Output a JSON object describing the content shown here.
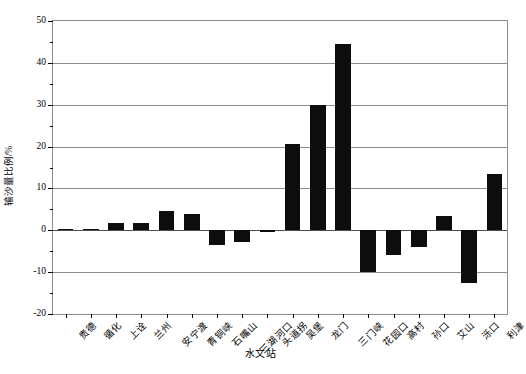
{
  "chart_data": {
    "type": "bar",
    "title": "",
    "xlabel": "水文站",
    "ylabel": "输沙量比例/%",
    "ylim": [
      -20,
      50
    ],
    "yticks": [
      -20,
      -10,
      0,
      10,
      20,
      30,
      40,
      50
    ],
    "ytick_labels": [
      "-20",
      "-10",
      "0",
      "10",
      "20",
      "30",
      "40",
      "50"
    ],
    "minor_ytick_step": 5,
    "grid": "horizontal",
    "legend": "none",
    "bar_color": "#0d0d0d",
    "categories": [
      "贵德",
      "循化",
      "上诠",
      "兰州",
      "安宁渡",
      "青铜峡",
      "石嘴山",
      "三湖河口",
      "头道拐",
      "吴堡",
      "龙门",
      "三门峡",
      "花园口",
      "高村",
      "孙口",
      "艾山",
      "泺口",
      "利津"
    ],
    "values": [
      0.3,
      0.4,
      1.8,
      1.8,
      4.5,
      3.8,
      -3.5,
      -2.8,
      -0.4,
      20.5,
      30.0,
      44.5,
      -10.0,
      -6.0,
      -4.0,
      3.3,
      -12.5,
      13.5
    ]
  }
}
